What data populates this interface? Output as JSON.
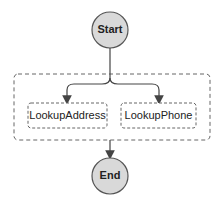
{
  "diagram": {
    "type": "state-machine",
    "start": {
      "label": "Start"
    },
    "end": {
      "label": "End"
    },
    "parallel_group": {
      "branches": [
        {
          "label": "LookupAddress"
        },
        {
          "label": "LookupPhone"
        }
      ]
    },
    "colors": {
      "terminal_fill": "#d9d9d9",
      "stroke": "#555555",
      "dashed": "#666666",
      "text": "#222222"
    }
  }
}
